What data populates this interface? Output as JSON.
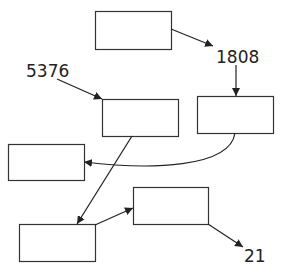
{
  "diagram": {
    "width": 282,
    "height": 272,
    "colors": {
      "stroke": "#333333",
      "text": "#222222",
      "background": "#ffffff"
    },
    "nodes": [
      {
        "id": "box-top",
        "x": 95,
        "y": 11,
        "w": 76,
        "h": 38
      },
      {
        "id": "box-right",
        "x": 197,
        "y": 96,
        "w": 76,
        "h": 37
      },
      {
        "id": "box-middle",
        "x": 102,
        "y": 99,
        "w": 76,
        "h": 37
      },
      {
        "id": "box-left",
        "x": 8,
        "y": 144,
        "w": 76,
        "h": 36
      },
      {
        "id": "box-bottom-middle",
        "x": 133,
        "y": 187,
        "w": 75,
        "h": 37
      },
      {
        "id": "box-bottom-left",
        "x": 19,
        "y": 224,
        "w": 76,
        "h": 37
      }
    ],
    "labels": {
      "label_1808": "1808",
      "label_5376": "5376",
      "label_21": "21"
    },
    "edges": [
      {
        "from": "box-top",
        "to": "label-1808"
      },
      {
        "from": "label-1808",
        "to": "box-right"
      },
      {
        "from": "label-5376",
        "to": "box-middle"
      },
      {
        "from": "box-right",
        "to": "box-left",
        "style": "curved"
      },
      {
        "from": "box-middle",
        "to": "box-bottom-left"
      },
      {
        "from": "box-bottom-left",
        "to": "box-bottom-middle"
      },
      {
        "from": "box-bottom-middle",
        "to": "label-21"
      }
    ]
  }
}
